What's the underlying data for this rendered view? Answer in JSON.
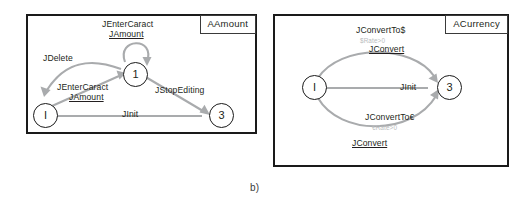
{
  "figure": {
    "caption": "b)",
    "panels": [
      {
        "id": "left",
        "class_tag": "AAmount",
        "states": [
          {
            "id": "I",
            "label": "I"
          },
          {
            "id": "1",
            "label": "1"
          },
          {
            "id": "3",
            "label": "3"
          }
        ],
        "transitions": [
          {
            "id": "self-1",
            "from": "1",
            "to": "1",
            "event": "JEnterCaract",
            "guard": "JAmount",
            "guard_underlined": true
          },
          {
            "id": "1-to-I",
            "from": "1",
            "to": "I",
            "event": "JDelete",
            "guard": "",
            "guard_underlined": false
          },
          {
            "id": "I-to-1",
            "from": "I",
            "to": "1",
            "event": "JEnterCaract",
            "guard": "JAmount",
            "guard_underlined": true
          },
          {
            "id": "1-to-3",
            "from": "1",
            "to": "3",
            "event": "JStopEditing",
            "guard": "",
            "guard_underlined": false
          },
          {
            "id": "3-to-I",
            "from": "3",
            "to": "I",
            "event": "JInit",
            "guard": "",
            "guard_underlined": false
          }
        ]
      },
      {
        "id": "right",
        "class_tag": "ACurrency",
        "states": [
          {
            "id": "I",
            "label": "I"
          },
          {
            "id": "3",
            "label": "3"
          }
        ],
        "transitions": [
          {
            "id": "top-I-to-3",
            "from": "I",
            "to": "3",
            "event": "JConvertTo$",
            "condition": "$Rate>0",
            "guard": "JConvert",
            "guard_underlined": true
          },
          {
            "id": "3-to-I",
            "from": "3",
            "to": "I",
            "event": "JInit",
            "condition": "",
            "guard": "",
            "guard_underlined": false
          },
          {
            "id": "bottom-I-to-3",
            "from": "I",
            "to": "3",
            "event": "JConvertTo€",
            "condition": "€Rate>0",
            "guard": "JConvert",
            "guard_underlined": true
          }
        ]
      }
    ]
  },
  "colors": {
    "border": "#1a1a1a",
    "edge": "#a9abad",
    "faint_text": "#b9bcbe",
    "text": "#231f20"
  }
}
